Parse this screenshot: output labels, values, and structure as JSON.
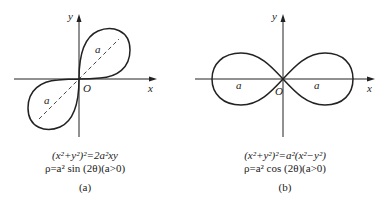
{
  "figures": [
    {
      "id": "a",
      "axis_x_label": "x",
      "axis_y_label": "y",
      "origin_label": "O",
      "loop_labels": [
        "a",
        "a"
      ],
      "equation_cartesian": "(x²+y²)²=2a²xy",
      "equation_polar": "ρ=a² sin (2θ)(a>0)",
      "sub_label": "(a)"
    },
    {
      "id": "b",
      "axis_x_label": "x",
      "axis_y_label": "y",
      "origin_label": "O",
      "loop_labels": [
        "a",
        "a"
      ],
      "equation_cartesian": "(x²+y²)²=a²(x²−y²)",
      "equation_polar": "ρ=a² cos (2θ)(a>0)",
      "sub_label": "(b)"
    }
  ],
  "colors": {
    "stroke": "#222222",
    "background": "#ffffff"
  }
}
